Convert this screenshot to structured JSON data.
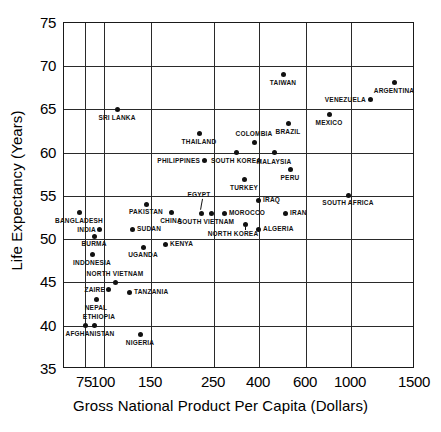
{
  "chart_data": {
    "type": "scatter",
    "title": "",
    "xlabel": "Gross National Product Per Capita (Dollars)",
    "ylabel": "Life Expectancy (Years)",
    "x_scale": "log-irregular",
    "xticks": [
      75,
      100,
      150,
      250,
      400,
      600,
      1000,
      1500
    ],
    "xtick_labels": [
      "75",
      "100",
      "150",
      "250",
      "400",
      "600",
      "1000",
      "1500"
    ],
    "yticks": [
      35,
      40,
      45,
      50,
      55,
      60,
      65,
      70,
      75
    ],
    "ytick_labels": [
      "35",
      "40",
      "45",
      "50",
      "55",
      "60",
      "65",
      "70",
      "75"
    ],
    "ylim": [
      35,
      75
    ],
    "grid": true,
    "legend": "none",
    "points": [
      {
        "name": "SRI LANKA",
        "gnp": 130,
        "life": 65.0,
        "px": 116,
        "py": 108,
        "lx": 116,
        "ly": 117,
        "align": "c"
      },
      {
        "name": "TAIWAN",
        "gnp": 420,
        "life": 69.0,
        "px": 282,
        "py": 73,
        "lx": 282,
        "ly": 82,
        "align": "c"
      },
      {
        "name": "ARGENTINA",
        "gnp": 1100,
        "life": 68.0,
        "px": 393,
        "py": 81,
        "lx": 393,
        "ly": 90,
        "align": "c"
      },
      {
        "name": "VENEZUELA",
        "gnp": 1000,
        "life": 66.0,
        "px": 369,
        "py": 98,
        "lx": 365,
        "ly": 99,
        "align": "r"
      },
      {
        "name": "MEXICO",
        "gnp": 700,
        "life": 64.3,
        "px": 328,
        "py": 113,
        "lx": 328,
        "ly": 122,
        "align": "c"
      },
      {
        "name": "BRAZIL",
        "gnp": 430,
        "life": 63.3,
        "px": 287,
        "py": 122,
        "lx": 287,
        "ly": 131,
        "align": "c"
      },
      {
        "name": "THAILAND",
        "gnp": 210,
        "life": 62.2,
        "px": 198,
        "py": 132,
        "lx": 198,
        "ly": 141,
        "align": "c"
      },
      {
        "name": "COLOMBIA",
        "gnp": 320,
        "life": 61.2,
        "px": 253,
        "py": 141,
        "lx": 253,
        "ly": 133,
        "align": "c"
      },
      {
        "name": "SOUTH KOREA",
        "gnp": 270,
        "life": 60.0,
        "px": 235,
        "py": 151,
        "lx": 235,
        "ly": 160,
        "align": "c"
      },
      {
        "name": "MALAYSIA",
        "gnp": 370,
        "life": 60.0,
        "px": 273,
        "py": 151,
        "lx": 273,
        "ly": 161,
        "align": "c"
      },
      {
        "name": "PHILIPPINES",
        "gnp": 220,
        "life": 59.0,
        "px": 203,
        "py": 159,
        "lx": 199,
        "ly": 160,
        "align": "r"
      },
      {
        "name": "PERU",
        "gnp": 390,
        "life": 58.1,
        "px": 289,
        "py": 168,
        "lx": 289,
        "ly": 177,
        "align": "c"
      },
      {
        "name": "TURKEY",
        "gnp": 290,
        "life": 57.2,
        "px": 243,
        "py": 178,
        "lx": 243,
        "ly": 187,
        "align": "c"
      },
      {
        "name": "SOUTH AFRICA",
        "gnp": 800,
        "life": 55.0,
        "px": 347,
        "py": 194,
        "lx": 347,
        "ly": 202,
        "align": "c"
      },
      {
        "name": "IRAQ",
        "gnp": 380,
        "life": 54.5,
        "px": 257,
        "py": 199,
        "lx": 262,
        "ly": 199,
        "align": "l"
      },
      {
        "name": "PAKISTAN",
        "gnp": 130,
        "life": 54.0,
        "px": 145,
        "py": 203,
        "lx": 145,
        "ly": 211,
        "align": "c"
      },
      {
        "name": "BANGLADESH",
        "gnp": 70,
        "life": 53.2,
        "px": 78,
        "py": 211,
        "lx": 78,
        "ly": 220,
        "align": "c"
      },
      {
        "name": "CHINA",
        "gnp": 170,
        "life": 53.2,
        "px": 170,
        "py": 211,
        "lx": 170,
        "ly": 220,
        "align": "c"
      },
      {
        "name": "MOROCCO",
        "gnp": 300,
        "life": 53.2,
        "px": 223,
        "py": 212,
        "lx": 228,
        "ly": 212,
        "align": "l"
      },
      {
        "name": "IRAN",
        "gnp": 470,
        "life": 53.2,
        "px": 284,
        "py": 212,
        "lx": 289,
        "ly": 212,
        "align": "l"
      },
      {
        "name": "EGYPT",
        "gnp": 230,
        "life": 53.4,
        "px": 200,
        "py": 212,
        "lx": 198,
        "ly": 194,
        "align": "c"
      },
      {
        "name": "SOUTH VIETNAM",
        "gnp": 250,
        "life": 53.2,
        "px": 210,
        "py": 212,
        "lx": 205,
        "ly": 221,
        "align": "c"
      },
      {
        "name": "NORTH KOREA",
        "gnp": 350,
        "life": 52.0,
        "px": 244,
        "py": 223,
        "lx": 232,
        "ly": 233,
        "align": "c"
      },
      {
        "name": "ALGERIA",
        "gnp": 390,
        "life": 51.0,
        "px": 257,
        "py": 228,
        "lx": 262,
        "ly": 228,
        "align": "l"
      },
      {
        "name": "INDIA",
        "gnp": 90,
        "life": 51.0,
        "px": 98,
        "py": 228,
        "lx": 95,
        "ly": 229,
        "align": "r"
      },
      {
        "name": "SUDAN",
        "gnp": 130,
        "life": 51.0,
        "px": 131,
        "py": 228,
        "lx": 136,
        "ly": 228,
        "align": "l"
      },
      {
        "name": "BURMA",
        "gnp": 88,
        "life": 50.2,
        "px": 93,
        "py": 235,
        "lx": 93,
        "ly": 243,
        "align": "c"
      },
      {
        "name": "KENYA",
        "gnp": 160,
        "life": 49.3,
        "px": 164,
        "py": 243,
        "lx": 169,
        "ly": 243,
        "align": "l"
      },
      {
        "name": "UGANDA",
        "gnp": 135,
        "life": 48.9,
        "px": 142,
        "py": 246,
        "lx": 142,
        "ly": 254,
        "align": "c"
      },
      {
        "name": "INDONESIA",
        "gnp": 86,
        "life": 48.1,
        "px": 91,
        "py": 253,
        "lx": 91,
        "ly": 262,
        "align": "c"
      },
      {
        "name": "NORTH VIETNAM",
        "gnp": 102,
        "life": 45.0,
        "px": 114,
        "py": 281,
        "lx": 114,
        "ly": 273,
        "align": "c"
      },
      {
        "name": "ZAIRE",
        "gnp": 98,
        "life": 44.3,
        "px": 107,
        "py": 288,
        "lx": 104,
        "ly": 289,
        "align": "r"
      },
      {
        "name": "TANZANIA",
        "gnp": 118,
        "life": 43.9,
        "px": 128,
        "py": 291,
        "lx": 133,
        "ly": 291,
        "align": "l"
      },
      {
        "name": "NEPAL",
        "gnp": 87,
        "life": 42.9,
        "px": 95,
        "py": 298,
        "lx": 95,
        "ly": 307,
        "align": "c"
      },
      {
        "name": "ETHIOPIA",
        "gnp": 85,
        "life": 40.0,
        "px": 93,
        "py": 324,
        "lx": 98,
        "ly": 316,
        "align": "c"
      },
      {
        "name": "AFGHANISTAN",
        "gnp": 76,
        "life": 40.0,
        "px": 84,
        "py": 324,
        "lx": 89,
        "ly": 333,
        "align": "c"
      },
      {
        "name": "NIGERIA",
        "gnp": 133,
        "file": "",
        "life": 39.0,
        "px": 139,
        "py": 333,
        "lx": 139,
        "ly": 342,
        "align": "c"
      }
    ]
  },
  "axes": {
    "x_title": "Gross National Product Per Capita (Dollars)",
    "y_title": "Life Expectancy (Years)",
    "x_ticks": [
      {
        "label": "75",
        "px": 84
      },
      {
        "label": "100",
        "px": 103
      },
      {
        "label": "150",
        "px": 150
      },
      {
        "label": "250",
        "px": 213
      },
      {
        "label": "400",
        "px": 258
      },
      {
        "label": "600",
        "px": 305
      },
      {
        "label": "1000",
        "px": 350
      },
      {
        "label": "1500",
        "px": 414
      }
    ],
    "y_ticks": [
      {
        "label": "75",
        "py": 22
      },
      {
        "label": "70",
        "py": 65
      },
      {
        "label": "65",
        "py": 108
      },
      {
        "label": "60",
        "py": 152
      },
      {
        "label": "55",
        "py": 195
      },
      {
        "label": "50",
        "py": 238
      },
      {
        "label": "45",
        "py": 281
      },
      {
        "label": "40",
        "py": 325
      },
      {
        "label": "35",
        "py": 368
      }
    ]
  }
}
